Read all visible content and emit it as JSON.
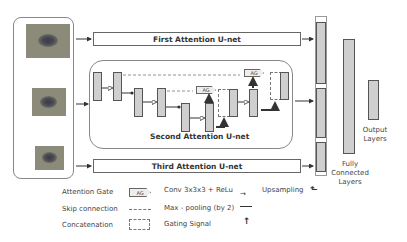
{
  "inputs": {
    "images": [
      {
        "name": "input-image-scale-1"
      },
      {
        "name": "input-image-scale-2"
      },
      {
        "name": "input-image-scale-3"
      }
    ]
  },
  "networks": {
    "first": "First Attention U-net",
    "second": "Second Attention U-net",
    "third": "Third Attention U-net"
  },
  "attention_gate_label": "AG",
  "right_side": {
    "fc_label": "Fully\nConnected\nLayers",
    "fc_lines": [
      "Fully",
      "Connected",
      "Layers"
    ],
    "output_lines": [
      "Output",
      "Layers"
    ]
  },
  "legend": {
    "attention_gate": "Attention Gate",
    "skip_connection": "Skip connection",
    "concatenation": "Concatenation",
    "conv": "Conv 3x3x3 + ReLu",
    "maxpool": "Max - pooling (by 2)",
    "gating": "Gating Signal",
    "upsampling": "Upsampling"
  },
  "colors": {
    "block_fill": "#cfcfcf",
    "block_border": "#555555",
    "image_bg": "#8c8b7a"
  }
}
